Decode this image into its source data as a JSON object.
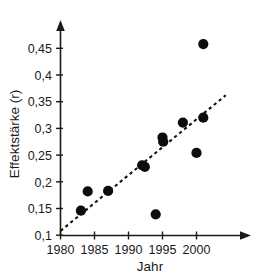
{
  "chart_data": {
    "type": "scatter",
    "title": "",
    "xlabel": "Jahr",
    "ylabel": "Effektstärke (r)",
    "xlim": [
      1978.5,
      2005.5
    ],
    "ylim": [
      0.092,
      0.482
    ],
    "grid": false,
    "legend": "none",
    "x_ticks": [
      1980,
      1985,
      1990,
      1995,
      2000
    ],
    "x_tick_labels": [
      "1980",
      "1985",
      "1990",
      "1995",
      "2000"
    ],
    "y_ticks": [
      0.1,
      0.15,
      0.2,
      0.25,
      0.3,
      0.35,
      0.4,
      0.45
    ],
    "y_tick_labels": [
      "0,1",
      "0,15",
      "0,2",
      "0,25",
      "0,3",
      "0,35",
      "0,4",
      "0,45"
    ],
    "marker": "filled-circle",
    "marker_color": "#0d0d0d",
    "points": [
      {
        "x": 1983,
        "y": 0.146
      },
      {
        "x": 1984,
        "y": 0.182
      },
      {
        "x": 1987,
        "y": 0.183
      },
      {
        "x": 1992,
        "y": 0.231
      },
      {
        "x": 1992.4,
        "y": 0.228
      },
      {
        "x": 1994,
        "y": 0.139
      },
      {
        "x": 1995,
        "y": 0.283
      },
      {
        "x": 1995.1,
        "y": 0.275
      },
      {
        "x": 1998,
        "y": 0.311
      },
      {
        "x": 2000,
        "y": 0.254
      },
      {
        "x": 2001,
        "y": 0.32
      },
      {
        "x": 2001,
        "y": 0.458
      }
    ],
    "trendline": {
      "style": "dashed",
      "color": "#111111",
      "x_start": 1980.0,
      "y_start": 0.108,
      "x_end": 2004.3,
      "y_end": 0.362
    }
  },
  "axes": {
    "x_axis_name": "Jahr",
    "y_axis_name": "Effektstärke (r)"
  }
}
